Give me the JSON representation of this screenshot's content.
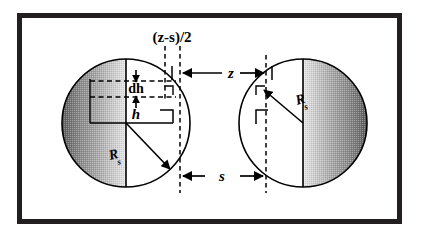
{
  "figure": {
    "frame": {
      "border_color": "#231f20",
      "background_color": "#ffffff",
      "x": 17,
      "y": 13,
      "width": 385,
      "height": 211,
      "border_width": 5
    },
    "colors": {
      "ink": "#000000",
      "sphere_shadow_dark": "#4a4a4a",
      "sphere_shadow_mid": "#8d8d8d",
      "sphere_shadow_light": "#d8d8d8",
      "sphere_face": "#ffffff",
      "dash": "#000000"
    },
    "labels": {
      "gap_expression": "(z-s)/2",
      "center_distance": "z",
      "surface_gap": "s",
      "cap_height": "h",
      "cap_increment": "dh",
      "radius_left": "R",
      "radius_left_sub": "s",
      "radius_right": "R",
      "radius_right_sub": "s"
    },
    "spheres": [
      {
        "name": "left-sphere",
        "cx": 126,
        "cy": 123,
        "r": 64,
        "shaded_side": "left",
        "flat_face_side": "right"
      },
      {
        "name": "right-sphere",
        "cx": 303,
        "cy": 123,
        "r": 64,
        "shaded_side": "right",
        "flat_face_side": "left"
      }
    ],
    "dimensions": {
      "z_line_y": 73,
      "s_line_y": 176,
      "left_dash_x": 180,
      "right_dash_x": 266,
      "inner_left_dash_x": 165,
      "h_baseline_y": 123,
      "dh_top_y": 81,
      "dh_bottom_y": 97
    }
  }
}
